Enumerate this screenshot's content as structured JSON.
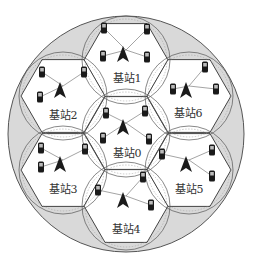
{
  "diagram": {
    "type": "cellular-network-layout",
    "colors": {
      "outer_fill": "#d9d9d9",
      "outer_stroke": "#555555",
      "hex_fill": "#ffffff",
      "hex_stroke": "#444444",
      "coverage_circle_stroke": "#555555",
      "device": "#1a1a1a",
      "link": "#666666"
    },
    "stations": [
      {
        "id": 0,
        "label": "基站0",
        "cx": 126,
        "cy": 133,
        "label_x": 127,
        "label_y": 152
      },
      {
        "id": 1,
        "label": "基站1",
        "cx": 126,
        "cy": 60,
        "label_x": 127,
        "label_y": 77
      },
      {
        "id": 2,
        "label": "基站2",
        "cx": 63,
        "cy": 96,
        "label_x": 63,
        "label_y": 114
      },
      {
        "id": 3,
        "label": "基站3",
        "cx": 63,
        "cy": 170,
        "label_x": 63,
        "label_y": 188
      },
      {
        "id": 4,
        "label": "基站4",
        "cx": 126,
        "cy": 206,
        "label_x": 126,
        "label_y": 228
      },
      {
        "id": 5,
        "label": "基站5",
        "cx": 189,
        "cy": 170,
        "label_x": 189,
        "label_y": 188
      },
      {
        "id": 6,
        "label": "基站6",
        "cx": 189,
        "cy": 96,
        "label_x": 188,
        "label_y": 112
      }
    ]
  }
}
